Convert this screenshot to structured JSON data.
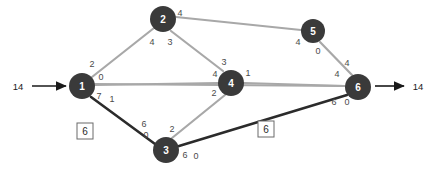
{
  "diagram": {
    "colors": {
      "node_fill": "#3a3a3a",
      "node_text": "#ffffff",
      "edge_light": "#a8a8a8",
      "edge_dark": "#2b2b2b",
      "label_text": "#4a4a4a",
      "box_stroke": "#6a6a6a",
      "background": "#ffffff"
    },
    "nodes": [
      {
        "id": "1",
        "label": "1",
        "cx": 82,
        "cy": 86,
        "r": 13
      },
      {
        "id": "2",
        "label": "2",
        "cx": 163,
        "cy": 19,
        "r": 13
      },
      {
        "id": "3",
        "label": "3",
        "cx": 166,
        "cy": 150,
        "r": 13
      },
      {
        "id": "4",
        "label": "4",
        "cx": 231,
        "cy": 83,
        "r": 13
      },
      {
        "id": "5",
        "label": "5",
        "cx": 313,
        "cy": 31,
        "r": 12
      },
      {
        "id": "6",
        "label": "6",
        "cx": 358,
        "cy": 87,
        "r": 13
      }
    ],
    "edges": [
      {
        "id": "e-1-2",
        "from": "1",
        "to": "2",
        "style": "light",
        "x1": 92,
        "y1": 77,
        "x2": 154,
        "y2": 28
      },
      {
        "id": "e-2-5",
        "from": "2",
        "to": "5",
        "style": "light",
        "x1": 176,
        "y1": 17,
        "x2": 301,
        "y2": 30
      },
      {
        "id": "e-2-4",
        "from": "2",
        "to": "4",
        "style": "light",
        "x1": 171,
        "y1": 31,
        "x2": 223,
        "y2": 71
      },
      {
        "id": "e-1-4",
        "from": "1",
        "to": "4",
        "style": "light",
        "x1": 95,
        "y1": 85,
        "x2": 218,
        "y2": 83
      },
      {
        "id": "e-1-6",
        "from": "1",
        "to": "6",
        "style": "light",
        "x1": 95,
        "y1": 84,
        "x2": 345,
        "y2": 86
      },
      {
        "id": "e-4-6",
        "from": "4",
        "to": "6",
        "style": "light",
        "x1": 244,
        "y1": 83,
        "x2": 345,
        "y2": 86
      },
      {
        "id": "e-5-6",
        "from": "5",
        "to": "6",
        "style": "light",
        "x1": 320,
        "y1": 42,
        "x2": 352,
        "y2": 75
      },
      {
        "id": "e-3-4",
        "from": "3",
        "to": "4",
        "style": "light",
        "x1": 172,
        "y1": 138,
        "x2": 225,
        "y2": 95
      },
      {
        "id": "e-1-3",
        "from": "1",
        "to": "3",
        "style": "dark",
        "x1": 91,
        "y1": 97,
        "x2": 155,
        "y2": 144
      },
      {
        "id": "e-3-6",
        "from": "3",
        "to": "6",
        "style": "dark",
        "x1": 179,
        "y1": 146,
        "x2": 347,
        "y2": 95
      }
    ],
    "edge_values": [
      {
        "id": "lbl-1-2-tail",
        "text": "2",
        "x": 92,
        "y": 64
      },
      {
        "id": "lbl-1-4-tail",
        "text": "0",
        "x": 101,
        "y": 77
      },
      {
        "id": "lbl-1-3-tail",
        "text": "7",
        "x": 99,
        "y": 96
      },
      {
        "id": "lbl-1-3-tail2",
        "text": "1",
        "x": 112,
        "y": 99
      },
      {
        "id": "lbl-2-1-head",
        "text": "4",
        "x": 152,
        "y": 42
      },
      {
        "id": "lbl-2-4-head",
        "text": "3",
        "x": 170,
        "y": 42
      },
      {
        "id": "lbl-2-5-tail",
        "text": "4",
        "x": 180,
        "y": 13
      },
      {
        "id": "lbl-5-2-head",
        "text": "4",
        "x": 298,
        "y": 42
      },
      {
        "id": "lbl-5-6-tail",
        "text": "0",
        "x": 318,
        "y": 51
      },
      {
        "id": "lbl-6-5-head",
        "text": "4",
        "x": 347,
        "y": 63
      },
      {
        "id": "lbl-4-2-head",
        "text": "3",
        "x": 224,
        "y": 62
      },
      {
        "id": "lbl-4-1-head",
        "text": "4",
        "x": 215,
        "y": 74
      },
      {
        "id": "lbl-4-6-tail",
        "text": "1",
        "x": 248,
        "y": 73
      },
      {
        "id": "lbl-4-3-head",
        "text": "2",
        "x": 214,
        "y": 93
      },
      {
        "id": "lbl-6-1-head",
        "text": "4",
        "x": 337,
        "y": 74
      },
      {
        "id": "lbl-6-3-head",
        "text": "6",
        "x": 334,
        "y": 102
      },
      {
        "id": "lbl-6-1-head2",
        "text": "0",
        "x": 347,
        "y": 102
      },
      {
        "id": "lbl-3-1-head",
        "text": "6",
        "x": 144,
        "y": 124
      },
      {
        "id": "lbl-3-1-head2",
        "text": "0",
        "x": 146,
        "y": 135
      },
      {
        "id": "lbl-3-4-tail",
        "text": "2",
        "x": 172,
        "y": 129
      },
      {
        "id": "lbl-3-6-tail",
        "text": "6",
        "x": 185,
        "y": 155
      },
      {
        "id": "lbl-3-6-tail2",
        "text": "0",
        "x": 196,
        "y": 156
      }
    ],
    "boxed_values": [
      {
        "id": "box-edge-1-3",
        "text": "6",
        "x": 85,
        "y": 131,
        "w": 16,
        "h": 16
      },
      {
        "id": "box-edge-3-6",
        "text": "6",
        "x": 266,
        "y": 129,
        "w": 16,
        "h": 16
      }
    ],
    "terminals": [
      {
        "id": "source-flow",
        "text": "14",
        "x": 18,
        "y": 86
      },
      {
        "id": "sink-flow",
        "text": "14",
        "x": 418,
        "y": 86
      }
    ],
    "arrows": [
      {
        "id": "source-arrow",
        "x1": 32,
        "y1": 86,
        "x2": 66,
        "y2": 86
      },
      {
        "id": "sink-arrow",
        "x1": 375,
        "y1": 86,
        "x2": 404,
        "y2": 86
      }
    ]
  }
}
